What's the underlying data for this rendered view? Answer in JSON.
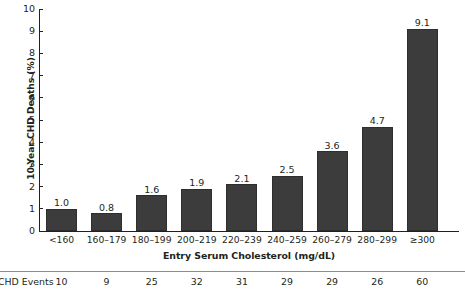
{
  "chart_data": {
    "type": "bar",
    "title": "",
    "xlabel": "Entry Serum Cholesterol (mg/dL)",
    "ylabel": "10-Year CHD Deaths (%)",
    "categories": [
      "<160",
      "160–179",
      "180–199",
      "200–219",
      "220–239",
      "240–259",
      "260–279",
      "280–299",
      "≥300"
    ],
    "values": [
      1.0,
      0.8,
      1.6,
      1.9,
      2.1,
      2.5,
      3.6,
      4.7,
      9.1
    ],
    "value_labels": [
      "1.0",
      "0.8",
      "1.6",
      "1.9",
      "2.1",
      "2.5",
      "3.6",
      "4.7",
      "9.1"
    ],
    "ylim": [
      0,
      10
    ],
    "yticks": [
      0,
      1,
      2,
      3,
      4,
      5,
      6,
      7,
      8,
      9,
      10
    ],
    "ytick_labels": [
      "0",
      "1",
      "2",
      "3",
      "4",
      "5",
      "6",
      "7",
      "8",
      "9",
      "10"
    ],
    "grid": false,
    "legend": null,
    "bar_color": "#3c3c3c",
    "axis_color": "#231f20",
    "series": [
      {
        "name": "10-Year CHD Deaths (%)",
        "values": [
          1.0,
          0.8,
          1.6,
          1.9,
          2.1,
          2.5,
          3.6,
          4.7,
          9.1
        ]
      }
    ]
  },
  "footer_table": {
    "row_label": "CHD Events",
    "values": [
      "10",
      "9",
      "25",
      "32",
      "31",
      "29",
      "29",
      "26",
      "60"
    ],
    "rule_color": "#8d8d8d"
  }
}
